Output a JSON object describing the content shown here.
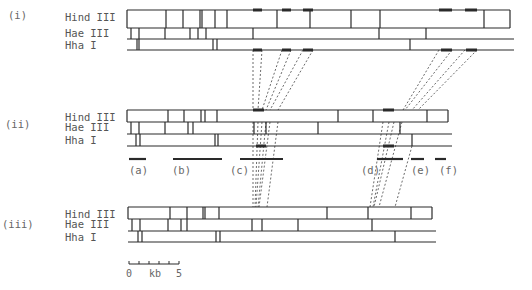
{
  "figure": {
    "ink": "#2a2a2a",
    "dash_color": "#444444",
    "panels": [
      {
        "id": "i",
        "label": "(i)",
        "label_x": 8,
        "label_y": 19,
        "enzymes": [
          "Hind III",
          "Hae III",
          "Hha I"
        ],
        "enzyme_label_x": 65,
        "rows_y": [
          10,
          28,
          39,
          50
        ],
        "x_start": 127,
        "x_end": 510,
        "hind_cuts": [
          166,
          183,
          200,
          202,
          215,
          227,
          277,
          310,
          351,
          380,
          484,
          510
        ],
        "hind_end_closed": true,
        "hae_cuts": [
          131,
          139,
          165,
          190,
          198,
          206,
          253,
          379,
          426,
          510
        ],
        "hha_cuts": [
          137,
          139,
          213,
          217,
          410
        ],
        "hind_highlights": [
          [
            253,
            262
          ],
          [
            282,
            291
          ],
          [
            303,
            313
          ],
          [
            439,
            452
          ],
          [
            465,
            477
          ]
        ],
        "hha_highlights": [
          [
            253,
            262
          ],
          [
            282,
            291
          ],
          [
            303,
            313
          ],
          [
            441,
            452
          ],
          [
            466,
            477
          ]
        ]
      },
      {
        "id": "ii",
        "label": "(ii)",
        "label_x": 5,
        "label_y": 128,
        "enzymes": [
          "Hind III",
          "Hae III",
          "Hha I"
        ],
        "enzyme_label_x": 65,
        "rows_y": [
          110,
          122,
          134,
          146
        ],
        "x_start": 127,
        "x_end": 448,
        "hind_cuts": [
          168,
          184,
          201,
          205,
          217,
          338,
          373,
          427,
          448
        ],
        "hind_end_closed": true,
        "hae_cuts": [
          131,
          139,
          165,
          188,
          193,
          254,
          266,
          318,
          400,
          448
        ],
        "hha_cuts": [
          136,
          140,
          215,
          218,
          412
        ],
        "hind_highlights": [
          [
            253,
            264
          ],
          [
            383,
            394
          ]
        ],
        "hha_highlights": [
          [
            256,
            266
          ],
          [
            383,
            394
          ]
        ]
      },
      {
        "id": "iii",
        "label": "(iii)",
        "label_x": 2,
        "label_y": 228,
        "enzymes": [
          "Hind III",
          "Hae III",
          "Hha I"
        ],
        "enzyme_label_x": 65,
        "rows_y": [
          207,
          219,
          231,
          242
        ],
        "x_start": 128,
        "x_end": 432,
        "hind_cuts": [
          170,
          187,
          203,
          205,
          219,
          327,
          368,
          411,
          432
        ],
        "hind_end_closed": true,
        "hae_cuts": [
          132,
          140,
          168,
          181,
          187,
          252,
          262,
          298,
          372,
          432
        ],
        "hha_cuts": [
          138,
          142,
          216,
          220,
          395
        ],
        "hind_highlights": [],
        "hha_highlights": []
      }
    ],
    "fragments": [
      {
        "label": "(a)",
        "x1": 129,
        "x2": 146,
        "y": 159,
        "label_x": 129,
        "label_y": 174
      },
      {
        "label": "(b)",
        "x1": 173,
        "x2": 222,
        "y": 159,
        "label_x": 172,
        "label_y": 174
      },
      {
        "label": "(c)",
        "x1": 240,
        "x2": 283,
        "y": 159,
        "label_x": 230,
        "label_y": 174
      },
      {
        "label": "(d)",
        "x1": 377,
        "x2": 403,
        "y": 159,
        "label_x": 361,
        "label_y": 174
      },
      {
        "label": "(e)",
        "x1": 411,
        "x2": 424,
        "y": 159,
        "label_x": 411,
        "label_y": 174
      },
      {
        "label": "(f)",
        "x1": 435,
        "x2": 446,
        "y": 159,
        "label_x": 439,
        "label_y": 174
      }
    ],
    "connectors": [
      [
        253,
        50,
        253,
        110
      ],
      [
        262,
        50,
        258,
        110
      ],
      [
        282,
        50,
        262,
        110
      ],
      [
        291,
        50,
        266,
        110
      ],
      [
        303,
        50,
        270,
        110
      ],
      [
        313,
        50,
        278,
        110
      ],
      [
        439,
        50,
        403,
        110
      ],
      [
        452,
        50,
        405,
        110
      ],
      [
        465,
        50,
        412,
        110
      ],
      [
        477,
        50,
        418,
        110
      ],
      [
        253,
        122,
        253,
        207
      ],
      [
        258,
        122,
        255,
        207
      ],
      [
        262,
        122,
        256,
        207
      ],
      [
        266,
        122,
        258,
        207
      ],
      [
        270,
        122,
        259,
        207
      ],
      [
        278,
        122,
        267,
        207
      ],
      [
        383,
        122,
        370,
        207
      ],
      [
        389,
        122,
        373,
        207
      ],
      [
        394,
        122,
        374,
        207
      ],
      [
        402,
        122,
        379,
        207
      ],
      [
        412,
        146,
        395,
        207
      ]
    ],
    "scale_bar": {
      "x1": 129,
      "x2": 179,
      "y": 264,
      "ticks": [
        129,
        139,
        149,
        159,
        169,
        179
      ],
      "label_left": "0",
      "label_mid": "kb",
      "label_right": "5",
      "label_y": 277
    }
  }
}
